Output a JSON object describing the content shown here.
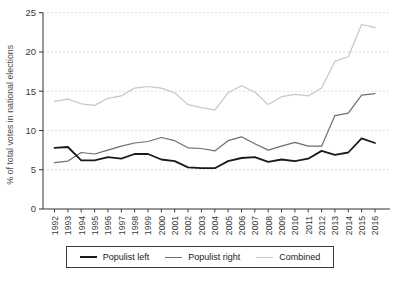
{
  "chart_data": {
    "type": "line",
    "title": "",
    "xlabel": "",
    "ylabel": "% of total votes in national elections",
    "ylim": [
      0,
      25
    ],
    "y_ticks": [
      0,
      5,
      10,
      15,
      20,
      25
    ],
    "grid": "horizontal-dashed",
    "legend_position": "bottom",
    "grid_color": "#d9d9d9",
    "axis_color": "#333333",
    "x": [
      1992,
      1993,
      1994,
      1995,
      1996,
      1997,
      1998,
      1999,
      2000,
      2001,
      2002,
      2003,
      2004,
      2005,
      2006,
      2007,
      2008,
      2009,
      2010,
      2011,
      2012,
      2013,
      2014,
      2015,
      2016
    ],
    "series": [
      {
        "name": "Populist left",
        "color": "#1a1a1a",
        "width": 1.8,
        "values": [
          7.8,
          7.9,
          6.2,
          6.2,
          6.6,
          6.4,
          7.0,
          7.0,
          6.3,
          6.1,
          5.3,
          5.2,
          5.2,
          6.1,
          6.5,
          6.6,
          6.0,
          6.3,
          6.1,
          6.4,
          7.4,
          6.9,
          7.2,
          9.0,
          8.4
        ]
      },
      {
        "name": "Populist right",
        "color": "#6e6e6e",
        "width": 1.2,
        "values": [
          5.9,
          6.1,
          7.2,
          7.0,
          7.5,
          8.0,
          8.4,
          8.6,
          9.1,
          8.7,
          7.8,
          7.7,
          7.4,
          8.7,
          9.2,
          8.3,
          7.5,
          8.0,
          8.5,
          8.0,
          8.0,
          11.9,
          12.2,
          14.5,
          14.7
        ]
      },
      {
        "name": "Combined",
        "color": "#c6c6c6",
        "width": 1.2,
        "values": [
          13.7,
          14.0,
          13.4,
          13.2,
          14.1,
          14.4,
          15.4,
          15.6,
          15.4,
          14.8,
          13.3,
          12.9,
          12.6,
          14.8,
          15.7,
          14.9,
          13.3,
          14.3,
          14.6,
          14.4,
          15.4,
          18.8,
          19.4,
          23.5,
          23.1
        ]
      }
    ]
  }
}
